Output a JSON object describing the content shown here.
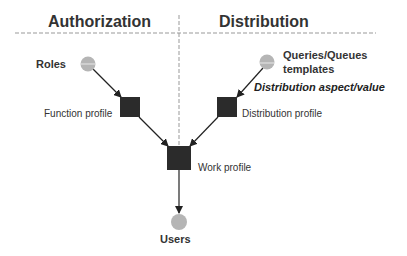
{
  "headers": {
    "left": "Authorization",
    "right": "Distribution"
  },
  "nodes": {
    "roles": {
      "label": "Roles",
      "shape": "circle"
    },
    "queries": {
      "label_line1": "Queries/Queues",
      "label_line2": "templates",
      "shape": "circle"
    },
    "function_profile": {
      "label": "Function profile",
      "shape": "square"
    },
    "distribution_profile": {
      "label": "Distribution profile",
      "shape": "square"
    },
    "work_profile": {
      "label": "Work profile",
      "shape": "square"
    },
    "users": {
      "label": "Users",
      "shape": "circle"
    }
  },
  "annotations": {
    "distribution_aspect": "Distribution aspect/value"
  },
  "colors": {
    "circle_fill": "#b5b5b5",
    "square_fill": "#2b2b2b",
    "divider": "#999999",
    "arrow": "#222222"
  }
}
